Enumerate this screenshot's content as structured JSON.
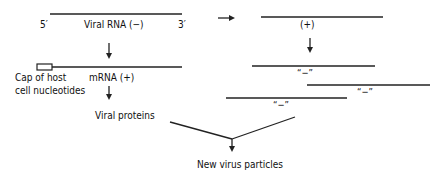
{
  "diagram": {
    "left": {
      "viral_rna": {
        "label": "Viral RNA (−)",
        "end5": "5′",
        "end3": "3′"
      },
      "mrna": {
        "label": "mRNA (+)",
        "cap_label_line1": "Cap of host",
        "cap_label_line2": "cell nucleotides"
      },
      "proteins": {
        "label": "Viral proteins"
      }
    },
    "right": {
      "plus_strand": {
        "label": "(+)"
      },
      "minus_strands": [
        {
          "label": "“−”"
        },
        {
          "label": "“−”"
        },
        {
          "label": "“−”"
        }
      ]
    },
    "output": {
      "label": "New virus particles"
    },
    "colors": {
      "ink": "#222222",
      "background": "#ffffff"
    }
  }
}
